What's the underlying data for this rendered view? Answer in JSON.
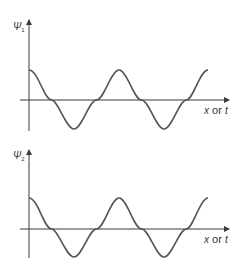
{
  "diagram": {
    "panels": [
      {
        "id": "psi1",
        "y_label": "Ψ",
        "y_label_subscript": "1",
        "x_label_var1": "x",
        "x_label_or": " or ",
        "x_label_var2": "t",
        "curve": "cosine"
      },
      {
        "id": "psi2",
        "y_label": "Ψ",
        "y_label_subscript": "2",
        "x_label_var1": "x",
        "x_label_or": " or ",
        "x_label_var2": "t",
        "curve": "cosine"
      }
    ],
    "colors": {
      "axis": "#3a3a3a",
      "curve": "#555555",
      "background": "#ffffff"
    }
  }
}
